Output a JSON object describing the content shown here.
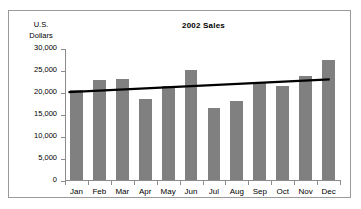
{
  "chart_data": {
    "type": "bar",
    "title": "2002 Sales",
    "xlabel": "",
    "ylabel": "U.S. Dollars",
    "ylabel_lines": [
      "U.S.",
      "Dollars"
    ],
    "categories": [
      "Jan",
      "Feb",
      "Mar",
      "Apr",
      "May",
      "Jun",
      "Jul",
      "Aug",
      "Sep",
      "Oct",
      "Nov",
      "Dec"
    ],
    "values": [
      20400,
      22800,
      23000,
      18300,
      21300,
      24900,
      16300,
      18000,
      22000,
      21400,
      23600,
      27300
    ],
    "series": [
      {
        "name": "Sales",
        "values": [
          20400,
          22800,
          23000,
          18300,
          21300,
          24900,
          16300,
          18000,
          22000,
          21400,
          23600,
          27300
        ]
      }
    ],
    "ylim": [
      0,
      30000
    ],
    "yticks": [
      0,
      5000,
      10000,
      15000,
      20000,
      25000,
      30000
    ],
    "ytick_labels": [
      "0",
      "5,000",
      "10,000",
      "15,000",
      "20,000",
      "25,000",
      "30,000"
    ],
    "grid": false,
    "legend": "none",
    "annotations": [
      {
        "type": "trendline",
        "name": "linear-trendline",
        "start_value": 20200,
        "end_value": 23100
      }
    ],
    "colors": {
      "bar": "#808080",
      "trendline": "#000000",
      "axis": "#8c8c8c",
      "text": "#000000",
      "background": "#ffffff",
      "frame_border": "#9a9a9a"
    }
  }
}
